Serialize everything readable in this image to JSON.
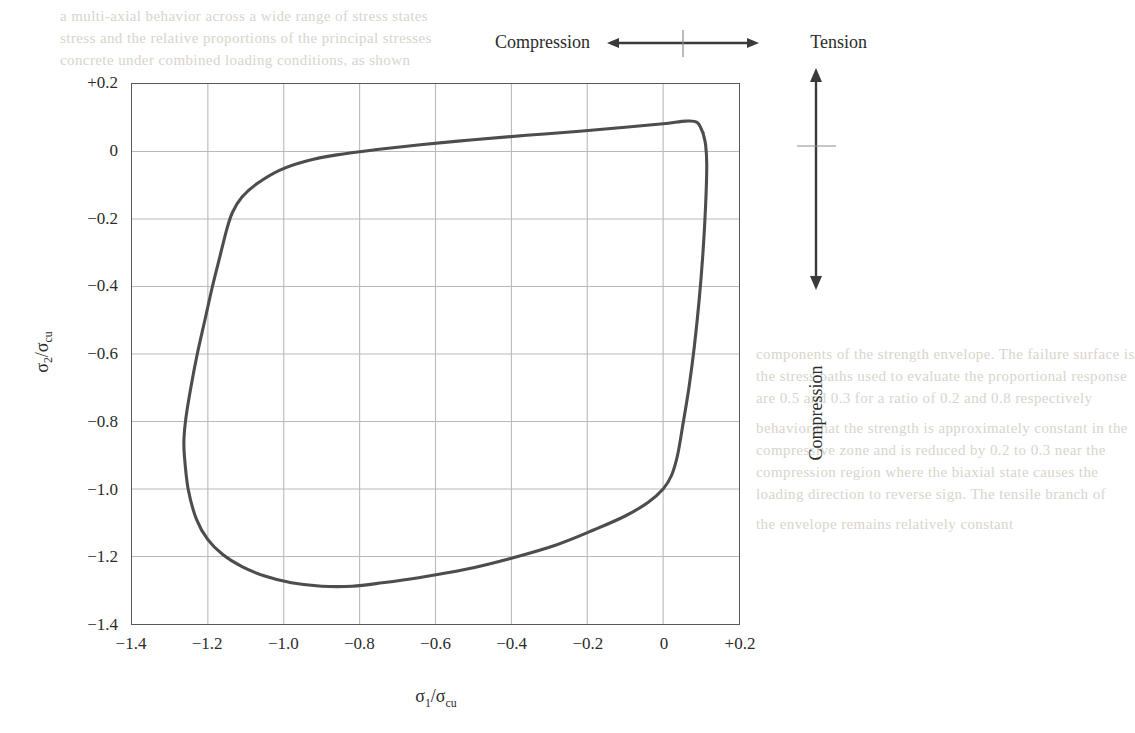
{
  "figure": {
    "kind": "biaxial-failure-envelope",
    "background_color": "#ffffff",
    "frame_color": "#585858",
    "grid_color": "#b9b9b9",
    "curve_color": "#4d4d4d",
    "text_color": "#2b2b2b"
  },
  "annotations": {
    "top": {
      "left_label": "Compression",
      "right_label": "Tension",
      "arrow": "double-headed-horizontal-arrow",
      "center_tick": true
    },
    "right": {
      "label": "Compression",
      "arrow": "double-headed-vertical-arrow",
      "center_tick": true
    }
  },
  "axes": {
    "x": {
      "title_main": "σ",
      "title_sub": "1",
      "title_denominator_main": "/σ",
      "title_denominator_sub": "cu",
      "title_plain": "σ1/σcu",
      "ticks": [
        "−1.4",
        "−1.2",
        "−1.0",
        "−0.8",
        "−0.6",
        "−0.4",
        "−0.2",
        "0",
        "+0.2"
      ],
      "min": -1.4,
      "max": 0.2,
      "step": 0.2
    },
    "y": {
      "title_plain": "σ2/σcu",
      "ticks": [
        "+0.2",
        "0",
        "−0.2",
        "−0.4",
        "−0.6",
        "−0.8",
        "−1.0",
        "−1.2",
        "−1.4"
      ],
      "min": -1.4,
      "max": 0.2,
      "step": 0.2
    }
  },
  "chart_data": {
    "type": "line",
    "title": "",
    "subtitle": "",
    "xlabel": "σ1/σcu",
    "ylabel": "σ2/σcu",
    "xlim": [
      -1.4,
      0.2
    ],
    "ylim": [
      -1.4,
      0.2
    ],
    "xticks": [
      -1.4,
      -1.2,
      -1.0,
      -0.8,
      -0.6,
      -0.4,
      -0.2,
      0,
      0.2
    ],
    "yticks": [
      -1.4,
      -1.2,
      -1.0,
      -0.8,
      -0.6,
      -0.4,
      -0.2,
      0,
      0.2
    ],
    "grid": true,
    "legend": null,
    "series": [
      {
        "name": "biaxial failure envelope",
        "closed": true,
        "points": [
          [
            0.105,
            0.055
          ],
          [
            0.112,
            0.02
          ],
          [
            0.115,
            -0.04
          ],
          [
            0.112,
            -0.16
          ],
          [
            0.105,
            -0.3
          ],
          [
            0.095,
            -0.44
          ],
          [
            0.082,
            -0.58
          ],
          [
            0.068,
            -0.7
          ],
          [
            0.052,
            -0.81
          ],
          [
            0.038,
            -0.9
          ],
          [
            0.022,
            -0.96
          ],
          [
            0.0,
            -1.0
          ],
          [
            -0.04,
            -1.04
          ],
          [
            -0.1,
            -1.08
          ],
          [
            -0.18,
            -1.12
          ],
          [
            -0.28,
            -1.165
          ],
          [
            -0.4,
            -1.205
          ],
          [
            -0.52,
            -1.238
          ],
          [
            -0.64,
            -1.262
          ],
          [
            -0.74,
            -1.278
          ],
          [
            -0.82,
            -1.288
          ],
          [
            -0.9,
            -1.288
          ],
          [
            -0.98,
            -1.278
          ],
          [
            -1.05,
            -1.258
          ],
          [
            -1.11,
            -1.23
          ],
          [
            -1.16,
            -1.195
          ],
          [
            -1.2,
            -1.15
          ],
          [
            -1.23,
            -1.09
          ],
          [
            -1.252,
            -1.0
          ],
          [
            -1.262,
            -0.9
          ],
          [
            -1.263,
            -0.85
          ],
          [
            -1.258,
            -0.79
          ],
          [
            -1.245,
            -0.7
          ],
          [
            -1.228,
            -0.6
          ],
          [
            -1.208,
            -0.5
          ],
          [
            -1.188,
            -0.4
          ],
          [
            -1.168,
            -0.31
          ],
          [
            -1.15,
            -0.23
          ],
          [
            -1.135,
            -0.18
          ],
          [
            -1.11,
            -0.135
          ],
          [
            -1.07,
            -0.095
          ],
          [
            -1.01,
            -0.055
          ],
          [
            -0.94,
            -0.028
          ],
          [
            -0.86,
            -0.01
          ],
          [
            -0.76,
            0.005
          ],
          [
            -0.64,
            0.02
          ],
          [
            -0.5,
            0.035
          ],
          [
            -0.36,
            0.048
          ],
          [
            -0.22,
            0.06
          ],
          [
            -0.1,
            0.072
          ],
          [
            0.0,
            0.082
          ],
          [
            0.06,
            0.09
          ],
          [
            0.09,
            0.086
          ],
          [
            0.105,
            0.055
          ]
        ],
        "key_features": {
          "uniaxial_compression_x": -1.0,
          "uniaxial_compression_y": -1.0,
          "equal_biaxial_compression": [
            -1.16,
            -1.16
          ],
          "max_biaxial_compression_strength_ratio": 1.29,
          "uniaxial_tension_ratio": 0.09
        }
      }
    ]
  },
  "bleed": {
    "lines": [
      "a multi-axial behavior across a wide range of stress states",
      "stress and the relative proportions of the principal stresses",
      "concrete under combined loading conditions, as shown",
      "components of the strength envelope. The failure surface is",
      "the stress paths used to evaluate the proportional response",
      "are 0.5 and 0.3 for a ratio of 0.2 and 0.8 respectively",
      "behavior that the strength is approximately constant in the",
      "compressive zone and is reduced by 0.2 to 0.3 near the",
      "compression region where the biaxial state causes the",
      "loading direction to reverse sign. The tensile branch of",
      "the envelope remains relatively constant"
    ]
  }
}
